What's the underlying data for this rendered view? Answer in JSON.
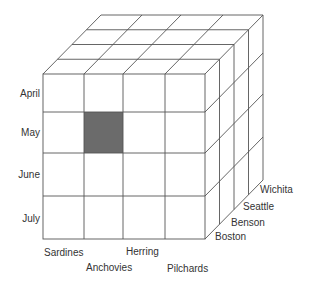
{
  "diagram": {
    "type": "data-cube",
    "line_color": "#555555",
    "highlight_color": "#6b6b6b",
    "highlight_cell": {
      "row": "May",
      "column": "Anchovies",
      "depth": "Boston"
    },
    "rows": [
      "April",
      "May",
      "June",
      "July"
    ],
    "columns": [
      "Sardines",
      "Anchovies",
      "Herring",
      "Pilchards"
    ],
    "depth": [
      "Boston",
      "Benson",
      "Seattle",
      "Wichita"
    ]
  }
}
